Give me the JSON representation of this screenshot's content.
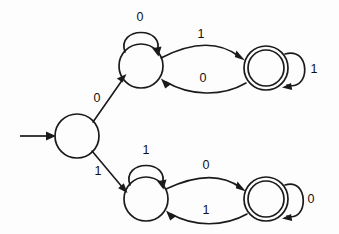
{
  "diagram": {
    "type": "state-machine",
    "background_color": "#fdfdfd",
    "stroke_color": "#1a1a1a",
    "label_color": "#111111",
    "alphabet": [
      "0",
      "1"
    ]
  },
  "states": [
    {
      "id": "q0",
      "role": "start",
      "accepting": false,
      "label": "",
      "cx": 77,
      "cy": 136,
      "r": 22
    },
    {
      "id": "q1",
      "role": "normal",
      "accepting": false,
      "label": "",
      "cx": 141,
      "cy": 66,
      "r": 22
    },
    {
      "id": "q2",
      "role": "accept",
      "accepting": true,
      "label": "",
      "cx": 266,
      "cy": 68,
      "r": 22,
      "r_inner": 18
    },
    {
      "id": "q3",
      "role": "normal",
      "accepting": false,
      "label": "",
      "cx": 146,
      "cy": 199,
      "r": 22
    },
    {
      "id": "q4",
      "role": "accept",
      "accepting": true,
      "label": "",
      "cx": 266,
      "cy": 199,
      "r": 22,
      "r_inner": 18
    }
  ],
  "transitions": [
    {
      "id": "t-start",
      "from": "",
      "to": "q0",
      "symbol": "",
      "kind": "start-arrow"
    },
    {
      "id": "t-q0-q1",
      "from": "q0",
      "to": "q1",
      "symbol": "0",
      "kind": "edge",
      "label_x": 97,
      "label_y": 99
    },
    {
      "id": "t-q0-q3",
      "from": "q0",
      "to": "q3",
      "symbol": "1",
      "kind": "edge",
      "label_x": 98,
      "label_y": 172
    },
    {
      "id": "t-q1-q1",
      "from": "q1",
      "to": "q1",
      "symbol": "0",
      "kind": "self-loop",
      "label_x": 140,
      "label_y": 18
    },
    {
      "id": "t-q1-q2",
      "from": "q1",
      "to": "q2",
      "symbol": "1",
      "kind": "edge",
      "label_x": 201,
      "label_y": 35
    },
    {
      "id": "t-q2-q1",
      "from": "q2",
      "to": "q1",
      "symbol": "0",
      "kind": "edge",
      "label_x": 203,
      "label_y": 79
    },
    {
      "id": "t-q2-q2",
      "from": "q2",
      "to": "q2",
      "symbol": "1",
      "kind": "self-loop",
      "label_x": 314,
      "label_y": 70
    },
    {
      "id": "t-q3-q3",
      "from": "q3",
      "to": "q3",
      "symbol": "1",
      "kind": "self-loop",
      "label_x": 146,
      "label_y": 151
    },
    {
      "id": "t-q3-q4",
      "from": "q3",
      "to": "q4",
      "symbol": "0",
      "kind": "edge",
      "label_x": 206,
      "label_y": 166
    },
    {
      "id": "t-q4-q3",
      "from": "q4",
      "to": "q3",
      "symbol": "1",
      "kind": "edge",
      "label_x": 206,
      "label_y": 211
    },
    {
      "id": "t-q4-q4",
      "from": "q4",
      "to": "q4",
      "symbol": "0",
      "kind": "self-loop",
      "label_x": 311,
      "label_y": 200
    }
  ],
  "labels": {
    "start_edge_upper": "0",
    "start_edge_lower": "1",
    "q1_self_loop": "0",
    "q1_to_q2": "1",
    "q2_to_q1": "0",
    "q2_self_loop": "1",
    "q3_self_loop": "1",
    "q3_to_q4": "0",
    "q4_to_q3": "1",
    "q4_self_loop": "0"
  }
}
